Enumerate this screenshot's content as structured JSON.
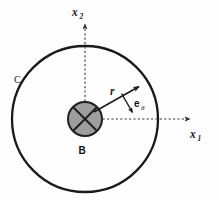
{
  "figure": {
    "background_color": "#fefefe",
    "stroke_color": "#1a1a1a",
    "body_fill_color": "#9e9e9e",
    "axis_color": "#333333"
  },
  "labels": {
    "axis_x1": "x",
    "axis_x1_sub": "1",
    "axis_x2": "x",
    "axis_x2_sub": "2",
    "radius": "r",
    "unit_vector": "e",
    "unit_vector_sub": "θ",
    "body": "B",
    "boundary_curve": "C"
  },
  "geometry": {
    "outer_circle": {
      "cx": 85,
      "cy": 119,
      "r": 73,
      "stroke_width": 2.3
    },
    "body_circle": {
      "cx": 85,
      "cy": 119,
      "r": 17,
      "stroke_width": 2.0
    },
    "x1_axis": {
      "x1": 85,
      "y1": 119,
      "x2": 192,
      "y2": 119
    },
    "x2_axis": {
      "x1": 85,
      "y1": 119,
      "x2": 85,
      "y2": 22
    },
    "r_vector": {
      "x1": 93,
      "y1": 112,
      "x2": 140,
      "y2": 86
    },
    "e_theta_vector": {
      "x1": 122,
      "y1": 94,
      "x2": 133,
      "y2": 113
    }
  }
}
